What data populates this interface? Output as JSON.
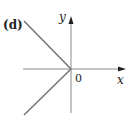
{
  "figure": {
    "panel_label": "(d)",
    "x_axis_label": "x",
    "y_axis_label": "y",
    "origin_label": "0",
    "colors": {
      "axes": "#888888",
      "curve": "#777777",
      "text": "#222222"
    }
  }
}
